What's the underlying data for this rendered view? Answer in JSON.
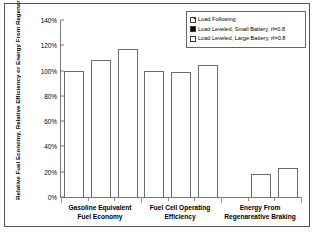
{
  "chart_data": {
    "type": "bar",
    "title": "",
    "xlabel": "",
    "ylabel": "Relative Fuel Economy, Relative Efficiency or Energy From Regenareative Braking (%)",
    "ylim": [
      0,
      140
    ],
    "ytick_labels": [
      "0%",
      "20%",
      "40%",
      "60%",
      "80%",
      "100%",
      "120%",
      "140%"
    ],
    "ytick_values": [
      0,
      20,
      40,
      60,
      80,
      100,
      120,
      140
    ],
    "grid": false,
    "legend_position": "top-right",
    "categories": [
      "Gasoline Equivalent Fuel Economy",
      "Fuel Cell Operating Efficiency",
      "Energy From Regenareative Braking"
    ],
    "category_lines": [
      [
        "Gasoline Equivalent",
        "Fuel Economy"
      ],
      [
        "Fuel Cell Operating",
        "Efficiency"
      ],
      [
        "Energy From",
        "Regenareative Braking"
      ]
    ],
    "series": [
      {
        "name": "Load Following",
        "marker": "hatch",
        "values": [
          100,
          100,
          0
        ]
      },
      {
        "name": "Load Leveled, Small Battery, rf=0.8",
        "marker": "solid",
        "values": [
          108,
          99,
          18.5
        ]
      },
      {
        "name": "Load Leveled, Large Battery, rf=0.8",
        "marker": "open",
        "values": [
          117,
          104.5,
          23
        ]
      }
    ]
  },
  "axis": {
    "ytitle": "Relative Fuel Economy, Relative Efficiency or Energy From Regenareative Braking (%)",
    "yticks": [
      {
        "label": "140%",
        "value": 140
      },
      {
        "label": "120%",
        "value": 120
      },
      {
        "label": "100%",
        "value": 100
      },
      {
        "label": "80%",
        "value": 80
      },
      {
        "label": "60%",
        "value": 60
      },
      {
        "label": "40%",
        "value": 40
      },
      {
        "label": "20%",
        "value": 20
      },
      {
        "label": "0%",
        "value": 0
      }
    ]
  },
  "xcategories": [
    {
      "line1": "Gasoline Equivalent",
      "line2": "Fuel Economy"
    },
    {
      "line1": "Fuel Cell Operating",
      "line2": "Efficiency"
    },
    {
      "line1": "Energy From",
      "line2": "Regenareative Braking"
    }
  ],
  "legend": {
    "entries": [
      {
        "label": "Load Following",
        "marker": "hatch"
      },
      {
        "label": "Load Leveled, Small Battery, rf=0.8",
        "marker": "solid"
      },
      {
        "label": "Load Leveled, Large Battery, rf=0.8",
        "marker": "open"
      }
    ]
  },
  "colors": {
    "frame": "#555555",
    "axis": "#777777",
    "bar_outline": "#6b6b6b",
    "bar_fill": "#ffffff",
    "background": "#ffffff",
    "text": "#000000"
  }
}
